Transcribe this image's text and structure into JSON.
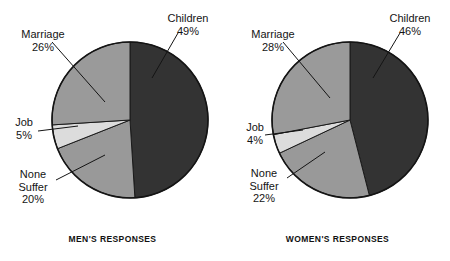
{
  "chart_data": [
    {
      "type": "pie",
      "title": "MEN'S RESPONSES",
      "categories": [
        "Children",
        "None Suffer",
        "Job",
        "Marriage"
      ],
      "values": [
        49,
        20,
        5,
        26
      ],
      "unit": "%",
      "colors": [
        "#333333",
        "#999999",
        "#dcdcdc",
        "#9a9a9a"
      ],
      "start_angle_deg": 0,
      "direction": "clockwise",
      "legend": "none",
      "labels": [
        {
          "name": "Children",
          "text": "Children",
          "pct": "49%"
        },
        {
          "name": "None Suffer",
          "text": "None\nSuffer",
          "pct": "20%"
        },
        {
          "name": "Job",
          "text": "Job",
          "pct": "5%"
        },
        {
          "name": "Marriage",
          "text": "Marriage",
          "pct": "26%"
        }
      ]
    },
    {
      "type": "pie",
      "title": "WOMEN'S RESPONSES",
      "categories": [
        "Children",
        "None Suffer",
        "Job",
        "Marriage"
      ],
      "values": [
        46,
        22,
        4,
        28
      ],
      "unit": "%",
      "colors": [
        "#333333",
        "#999999",
        "#dcdcdc",
        "#9a9a9a"
      ],
      "start_angle_deg": 0,
      "direction": "clockwise",
      "legend": "none",
      "labels": [
        {
          "name": "Children",
          "text": "Children",
          "pct": "46%"
        },
        {
          "name": "None Suffer",
          "text": "None\nSuffer",
          "pct": "22%"
        },
        {
          "name": "Job",
          "text": "Job",
          "pct": "4%"
        },
        {
          "name": "Marriage",
          "text": "Marriage",
          "pct": "28%"
        }
      ]
    }
  ],
  "men": {
    "caption": "MEN'S RESPONSES",
    "marriage_label": "Marriage",
    "marriage_pct": "26%",
    "job_label": "Job",
    "job_pct": "5%",
    "none_label_line1": "None",
    "none_label_line2": "Suffer",
    "none_pct": "20%",
    "children_label": "Children",
    "children_pct": "49%"
  },
  "women": {
    "caption": "WOMEN'S RESPONSES",
    "marriage_label": "Marriage",
    "marriage_pct": "28%",
    "job_label": "Job",
    "job_pct": "4%",
    "none_label_line1": "None",
    "none_label_line2": "Suffer",
    "none_pct": "22%",
    "children_label": "Children",
    "children_pct": "46%"
  }
}
